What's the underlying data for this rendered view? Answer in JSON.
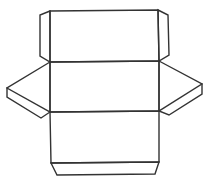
{
  "diagram": {
    "type": "net-of-3d-shape",
    "stroke_color": "#333333",
    "background_color": "#ffffff",
    "faces": {
      "top_panel": "M50,11 L158,10 L159,61 L50,62 Z",
      "middle_panel": "M50,62 L159,61 L159,111 L50,112 Z",
      "bottom_panel": "M50,112 L159,111 L159,162 L51,163 Z",
      "bottom_flap": "M51,163 L159,162 L155,174 L57,175 Z",
      "left_top_flap": "M50,11 L40,15 L40,56 L50,62 Z",
      "right_top_flap": "M158,10 L168,15 L169,55 L159,61 Z",
      "left_wing": "M50,62 L7,88 L7,97 L41,118 L50,112 Z",
      "right_wing": "M159,61 L202,84 L202,94 L169,115 L159,111 Z"
    },
    "creases": {
      "left_wing_inner": "M7,88 L50,112",
      "right_wing_inner": "M202,84 L159,111"
    }
  }
}
